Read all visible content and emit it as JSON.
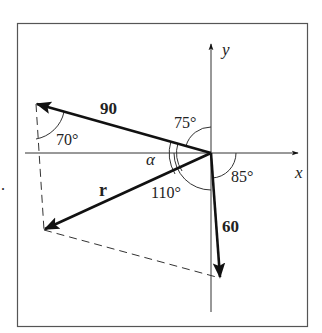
{
  "diagram": {
    "axes": {
      "x_label": "x",
      "y_label": "y"
    },
    "vectors": [
      {
        "name": "force-90",
        "label": "90",
        "magnitude": 90,
        "angle_label": "75°",
        "angle_ref": "from +y axis"
      },
      {
        "name": "force-60",
        "label": "60",
        "magnitude": 60,
        "angle_label": "85°",
        "angle_ref": "from +x axis"
      },
      {
        "name": "resultant",
        "label": "r"
      }
    ],
    "angles": {
      "a70": "70°",
      "a75": "75°",
      "a85": "85°",
      "a110": "110°",
      "alpha": "α"
    },
    "marker": "."
  }
}
